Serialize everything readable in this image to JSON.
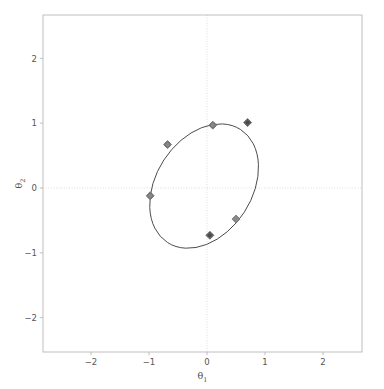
{
  "chart_data": {
    "type": "scatter",
    "title": "",
    "xlabel": "θ₁",
    "ylabel": "θ₂",
    "xlabel_base": "θ",
    "xlabel_sub": "1",
    "ylabel_base": "θ",
    "ylabel_sub": "2",
    "xlim": [
      -2.75,
      2.75
    ],
    "ylim": [
      -2.6,
      2.6
    ],
    "xticks": [
      -2,
      -1,
      0,
      1,
      2
    ],
    "xtick_labels": [
      "−2",
      "−1",
      "0",
      "1",
      "2"
    ],
    "yticks": [
      -2,
      -1,
      0,
      1,
      2
    ],
    "ytick_labels": [
      "−2",
      "−1",
      "0",
      "1",
      "2"
    ],
    "grid": "dotted-at-zero-only",
    "legend": "none",
    "points": [
      {
        "x": 0.1,
        "y": 0.97,
        "marker": "diamond-circle",
        "color": "#8a8a8a"
      },
      {
        "x": 0.7,
        "y": 1.01,
        "marker": "diamond-circle",
        "color": "#4a4a4a"
      },
      {
        "x": -0.68,
        "y": 0.67,
        "marker": "diamond-circle",
        "color": "#8a8a8a"
      },
      {
        "x": -0.98,
        "y": -0.12,
        "marker": "diamond-circle",
        "color": "#8a8a8a"
      },
      {
        "x": 0.5,
        "y": -0.48,
        "marker": "diamond",
        "color": "#8a8a8a"
      },
      {
        "x": 0.05,
        "y": -0.73,
        "marker": "diamond-circle",
        "color": "#4a4a4a"
      }
    ],
    "ellipse": {
      "center_x": -0.05,
      "center_y": 0.03,
      "semi_major": 1.16,
      "semi_minor": 0.74,
      "angle_deg": -57,
      "stroke": "#4a4a4a"
    },
    "colors": {
      "background": "#ffffff",
      "spine": "#b8b8b8",
      "grid": "#d9d9d9",
      "tick_text": "#555555",
      "axis_title": "#4d4d4d",
      "ellipse": "#4a4a4a",
      "marker_light": "#8a8a8a",
      "marker_dark": "#4a4a4a"
    },
    "axes_pixels": {
      "left": 43,
      "right": 362,
      "top": 15,
      "bottom": 352,
      "x_origin_px": 207.0,
      "y_origin_px": 188.0,
      "px_per_x_unit": 58.0,
      "px_per_y_unit": 64.8
    }
  }
}
